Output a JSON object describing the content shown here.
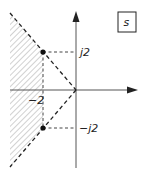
{
  "diagram": {
    "plane_label": "s",
    "labels": {
      "upper_imag": "j2",
      "lower_imag": "−j2",
      "real": "−2"
    },
    "poles": [
      {
        "re": -2,
        "im": 2
      },
      {
        "re": -2,
        "im": -2
      }
    ],
    "colors": {
      "line": "#222222",
      "hatch": "#9a9a9a",
      "background": "#ffffff"
    }
  }
}
